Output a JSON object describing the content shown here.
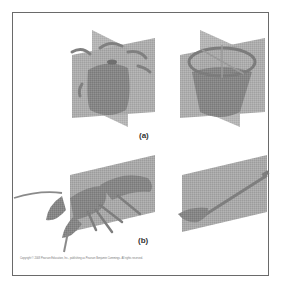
{
  "figure": {
    "panels": [
      {
        "id": "a",
        "label": "(a)",
        "description": "Radial symmetry",
        "items": [
          {
            "name": "sea-anemone",
            "caption": ""
          },
          {
            "name": "flower-pot",
            "caption": ""
          }
        ]
      },
      {
        "id": "b",
        "label": "(b)",
        "description": "Bilateral symmetry",
        "items": [
          {
            "name": "lobster",
            "caption": ""
          },
          {
            "name": "shovel",
            "caption": ""
          }
        ]
      }
    ],
    "copyright": "Copyright © 2008 Pearson Education, Inc., publishing as Pearson Benjamin Cummings. All rights reserved."
  },
  "colors": {
    "plane": "#a9a9a9",
    "organism": "#858585",
    "frame": "#6a6a6a",
    "background": "#ffffff"
  }
}
